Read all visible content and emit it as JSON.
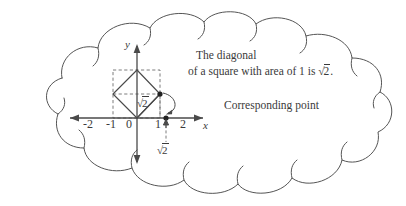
{
  "figure": {
    "kind": "thought-bubble-coordinate-diagram",
    "colors": {
      "ink": "#3a3a3a",
      "cloud_outline": "#555555",
      "axis": "#4a4a4a",
      "dashed": "#6e6e6e",
      "point": "#222222",
      "background": "#ffffff"
    },
    "cloud": {
      "name": "thought-bubble"
    },
    "caption": {
      "line1": "The diagonal",
      "line2_pre": "of a square with area of 1 is",
      "line2_radical": "√2",
      "line2_radicand": "2",
      "line2_post": "."
    },
    "annotation": {
      "corresponding_point": "Corresponding point",
      "diagonal_radical": "√2",
      "diagonal_radicand": "2",
      "axis_radical": "√2",
      "axis_radicand": "2"
    },
    "axes": {
      "x_label": "x",
      "y_label": "y",
      "x_ticks": [
        "-2",
        "-1",
        "0",
        "1",
        "2"
      ],
      "origin_label": "0"
    },
    "geometry": {
      "dashed_square": {
        "description": "axis-aligned dashed square",
        "x_from": -1,
        "x_to": 1,
        "y_from": 0,
        "y_to": 2
      },
      "diamond": {
        "description": "rotated unit-area square with diagonal sqrt(2)",
        "vertices": [
          [
            0,
            0
          ],
          [
            -1,
            1
          ],
          [
            0,
            2
          ],
          [
            1,
            1
          ]
        ],
        "area": 1,
        "diagonal": 1.41421356
      },
      "corresponding_point_on_axis": {
        "x": 1.41421356,
        "y": 0
      }
    }
  }
}
